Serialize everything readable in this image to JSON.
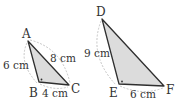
{
  "colors": {
    "fill": "#dcdcdc",
    "stroke": "#2f2f2f",
    "dashed": "#b8b8b8",
    "text": "#333333"
  },
  "triangles": [
    {
      "name": "ABC",
      "vertices": {
        "A": {
          "label": "A",
          "x": 28,
          "y": 41
        },
        "B": {
          "label": "B",
          "x": 39,
          "y": 82
        },
        "C": {
          "label": "C",
          "x": 69,
          "y": 85
        }
      },
      "right_angle_at": "B",
      "sides": {
        "AB": {
          "label": "6 cm"
        },
        "AC": {
          "label": "8 cm"
        },
        "BC": {
          "label": "4 cm"
        }
      }
    },
    {
      "name": "DEF",
      "vertices": {
        "D": {
          "label": "D",
          "x": 102,
          "y": 19
        },
        "E": {
          "label": "E",
          "x": 119,
          "y": 84
        },
        "F": {
          "label": "F",
          "x": 164,
          "y": 86
        }
      },
      "right_angle_at": "E",
      "sides": {
        "DE": {
          "label": "9 cm"
        },
        "EF": {
          "label": "6 cm"
        }
      }
    }
  ]
}
